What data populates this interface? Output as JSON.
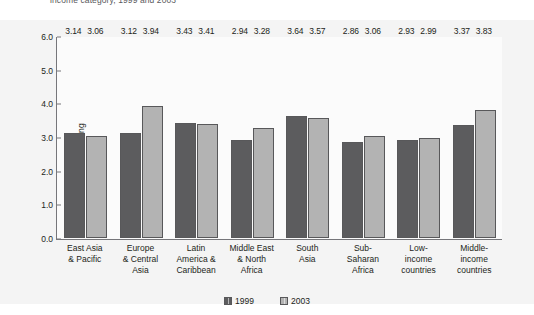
{
  "caption": "income category, 1999 and 2003",
  "legend": {
    "position": "bottom-center",
    "items": [
      {
        "label": "1999",
        "color": "#5c5c5e",
        "swatch": "series-swatch-1999"
      },
      {
        "label": "2003",
        "color": "#b3b3b3",
        "swatch": "series-swatch-2003"
      }
    ]
  },
  "axis": {
    "y_title": "Rating",
    "y_ticks": [
      "0.0",
      "1.0",
      "2.0",
      "3.0",
      "4.0",
      "5.0",
      "6.0"
    ]
  },
  "chart_data": {
    "type": "bar",
    "title": "income category, 1999 and 2003",
    "xlabel": "",
    "ylabel": "Rating",
    "ylim": [
      0,
      6
    ],
    "ytick_step": 1.0,
    "grid": false,
    "legend_position": "bottom-center",
    "categories": [
      "East Asia & Pacific",
      "Europe & Central Asia",
      "Latin America & Caribbean",
      "Middle East & North Africa",
      "South Asia",
      "Sub-Saharan Africa",
      "Low-income countries",
      "Middle-income countries"
    ],
    "category_lines": [
      [
        "East Asia",
        "& Pacific"
      ],
      [
        "Europe",
        "& Central",
        "Asia"
      ],
      [
        "Latin",
        "America &",
        "Caribbean"
      ],
      [
        "Middle East",
        "& North",
        "Africa"
      ],
      [
        "South",
        "Asia"
      ],
      [
        "Sub-",
        "Saharan",
        "Africa"
      ],
      [
        "Low-",
        "income",
        "countries"
      ],
      [
        "Middle-",
        "income",
        "countries"
      ]
    ],
    "series": [
      {
        "name": "1999",
        "color": "#5c5c5e",
        "values": [
          3.14,
          3.12,
          3.43,
          2.94,
          3.64,
          2.86,
          2.93,
          3.37
        ]
      },
      {
        "name": "2003",
        "color": "#b3b3b3",
        "values": [
          3.06,
          3.94,
          3.41,
          3.28,
          3.57,
          3.06,
          2.99,
          3.83
        ]
      }
    ]
  }
}
